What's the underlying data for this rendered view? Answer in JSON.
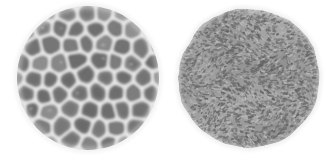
{
  "figure": {
    "type": "micrograph-comparison-plate",
    "canvas": {
      "width": 326,
      "height": 155
    },
    "background_color": "#ffffff",
    "panel_count": 2
  },
  "panels": [
    {
      "id": "left-specimen",
      "position_label": "left",
      "shape": "circular",
      "outline": "smooth-soft-edged",
      "texture_name": "reticulate-foveolate",
      "texture_description": "coarse network of large irregular rounded-polygonal dark lumina separated by pale raised walls",
      "center_x": 88,
      "center_y": 78,
      "radius_x": 71,
      "radius_y": 72,
      "bounds": {
        "x": 17,
        "y": 6,
        "width": 143,
        "height": 144
      },
      "cell_count": 58,
      "cell_size_px": 15,
      "wall_width_px": 3.4,
      "colors": {
        "lumen_dark": "#6a6a6a",
        "lumen_mid": "#7e7e7e",
        "lumen_light": "#909090",
        "wall_light": "#e4e4e4",
        "wall_mid": "#d2d2d2",
        "rim_halo": "#efefef"
      },
      "blur_px": 1.15,
      "seed": 1734
    },
    {
      "id": "right-specimen",
      "position_label": "right",
      "shape": "circular",
      "outline": "slightly-irregular-bumpy",
      "texture_name": "rugulate-vermiculate",
      "texture_description": "dense fine field of short dark dashes loosely aligned into short wavy rows on a mid-grey body",
      "center_x": 249,
      "center_y": 78,
      "radius_x": 71,
      "radius_y": 70,
      "bounds": {
        "x": 178,
        "y": 8,
        "width": 142,
        "height": 140
      },
      "dash_count": 2600,
      "dash_length_px": 3.1,
      "dash_width_px": 1.5,
      "colors": {
        "body_base": "#9a9a9a",
        "dash_dark": "#6e6e6e",
        "dash_darker": "#5f5f5f",
        "highlight_light": "#b8b8b8",
        "rim_halo": "#efefef"
      },
      "blur_px": 0.75,
      "seed": 9281
    }
  ],
  "chart_data": {
    "type": "heatmap",
    "title": "",
    "xlabel": "",
    "ylabel": "",
    "legend": [],
    "annotations": [],
    "series": [
      {
        "name": "left-specimen",
        "texture": "reticulate-foveolate",
        "feature_count": 58,
        "feature_size_px": 15,
        "tone_min": "#6a6a6a",
        "tone_max": "#e4e4e4"
      },
      {
        "name": "right-specimen",
        "texture": "rugulate-vermiculate",
        "feature_count": 2600,
        "feature_size_px": 3,
        "tone_min": "#5f5f5f",
        "tone_max": "#b8b8b8"
      }
    ]
  }
}
